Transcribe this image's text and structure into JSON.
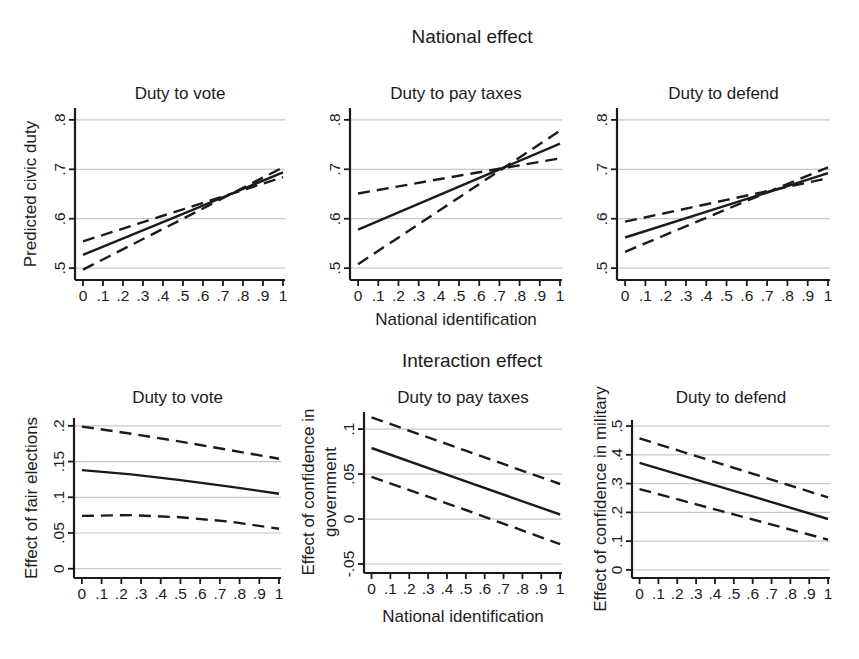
{
  "figure": {
    "row_titles": [
      "National effect",
      "Interaction effect"
    ],
    "x_axis": {
      "label": "National identification",
      "ticks": [
        0,
        0.1,
        0.2,
        0.3,
        0.4,
        0.5,
        0.6,
        0.7,
        0.8,
        0.9,
        1
      ],
      "tick_labels": [
        "0",
        ".1",
        ".2",
        ".3",
        ".4",
        ".5",
        ".6",
        ".7",
        ".8",
        ".9",
        "1"
      ],
      "xlim": [
        -0.04,
        1.01
      ]
    },
    "colors": {
      "line": "#1b1b1b",
      "grid": "#c8c8c8",
      "background": "#ffffff"
    },
    "grid": true,
    "legend": "none"
  },
  "chart_data": [
    {
      "type": "line",
      "title": "Duty to vote",
      "ylabel": "Predicted civic duty",
      "ylabel_lines": [
        "Predicted civic duty"
      ],
      "xlabel": "",
      "x": [
        0,
        0.5,
        1
      ],
      "series": [
        {
          "name": "estimate",
          "style": "solid",
          "y": [
            0.527,
            0.61,
            0.694
          ]
        },
        {
          "name": "ci-dashed-a",
          "style": "dashed",
          "y": [
            0.554,
            0.619,
            0.684
          ]
        },
        {
          "name": "ci-dashed-b",
          "style": "dashed",
          "y": [
            0.497,
            0.6,
            0.704
          ]
        }
      ],
      "ylim": [
        0.476,
        0.824
      ],
      "yticks": [
        0.5,
        0.6,
        0.7,
        0.8
      ],
      "ytick_labels": [
        ".5",
        ".6",
        ".7",
        ".8"
      ]
    },
    {
      "type": "line",
      "title": "Duty to pay taxes",
      "ylabel": "",
      "ylabel_lines": [],
      "xlabel": "National identification",
      "x": [
        0,
        0.5,
        1
      ],
      "series": [
        {
          "name": "estimate",
          "style": "solid",
          "y": [
            0.578,
            0.665,
            0.752
          ]
        },
        {
          "name": "ci-dashed-a",
          "style": "dashed",
          "y": [
            0.651,
            0.687,
            0.722
          ]
        },
        {
          "name": "ci-dashed-b",
          "style": "dashed",
          "y": [
            0.508,
            0.643,
            0.778
          ]
        }
      ],
      "ylim": [
        0.476,
        0.824
      ],
      "yticks": [
        0.5,
        0.6,
        0.7,
        0.8
      ],
      "ytick_labels": [
        ".5",
        ".6",
        ".7",
        ".8"
      ]
    },
    {
      "type": "line",
      "title": "Duty to defend",
      "ylabel": "",
      "ylabel_lines": [],
      "xlabel": "",
      "x": [
        0,
        0.5,
        1
      ],
      "series": [
        {
          "name": "estimate",
          "style": "solid",
          "y": [
            0.562,
            0.627,
            0.692
          ]
        },
        {
          "name": "ci-dashed-a",
          "style": "dashed",
          "y": [
            0.594,
            0.638,
            0.682
          ]
        },
        {
          "name": "ci-dashed-b",
          "style": "dashed",
          "y": [
            0.533,
            0.619,
            0.704
          ]
        }
      ],
      "ylim": [
        0.476,
        0.824
      ],
      "yticks": [
        0.5,
        0.6,
        0.7,
        0.8
      ],
      "ytick_labels": [
        ".5",
        ".6",
        ".7",
        ".8"
      ]
    },
    {
      "type": "line",
      "title": "Duty to vote",
      "ylabel": "Effect of fair elections",
      "ylabel_lines": [
        "Effect of fair elections"
      ],
      "xlabel": "",
      "x": [
        0,
        0.25,
        0.5,
        0.75,
        1
      ],
      "series": [
        {
          "name": "estimate",
          "style": "solid",
          "y": [
            0.138,
            0.132,
            0.124,
            0.115,
            0.105
          ]
        },
        {
          "name": "ci-upper",
          "style": "dashed",
          "y": [
            0.199,
            0.189,
            0.178,
            0.166,
            0.154
          ]
        },
        {
          "name": "ci-lower",
          "style": "dashed",
          "y": [
            0.074,
            0.075,
            0.072,
            0.066,
            0.056
          ]
        }
      ],
      "ylim": [
        -0.013,
        0.211
      ],
      "yticks": [
        0,
        0.05,
        0.1,
        0.15,
        0.2
      ],
      "ytick_labels": [
        "0",
        ".05",
        ".1",
        ".15",
        ".2"
      ]
    },
    {
      "type": "line",
      "title": "Duty to pay taxes",
      "ylabel": "Effect of confidence in government",
      "ylabel_lines": [
        "Effect of confidence in",
        "government"
      ],
      "xlabel": "National identification",
      "x": [
        0,
        0.5,
        1
      ],
      "series": [
        {
          "name": "estimate",
          "style": "solid",
          "y": [
            0.079,
            0.042,
            0.005
          ]
        },
        {
          "name": "ci-upper",
          "style": "dashed",
          "y": [
            0.113,
            0.076,
            0.039
          ]
        },
        {
          "name": "ci-lower",
          "style": "dashed",
          "y": [
            0.047,
            0.01,
            -0.028
          ]
        }
      ],
      "ylim": [
        -0.06,
        0.119
      ],
      "yticks": [
        -0.05,
        0,
        0.05,
        0.1
      ],
      "ytick_labels": [
        "-.05",
        "0",
        ".05",
        ".1"
      ]
    },
    {
      "type": "line",
      "title": "Duty to defend",
      "ylabel": "Effect of confidence in military",
      "ylabel_lines": [
        "Effect of confidence in military"
      ],
      "xlabel": "",
      "x": [
        0,
        0.5,
        1
      ],
      "series": [
        {
          "name": "estimate",
          "style": "solid",
          "y": [
            0.372,
            0.275,
            0.177
          ]
        },
        {
          "name": "ci-upper",
          "style": "dashed",
          "y": [
            0.457,
            0.355,
            0.252
          ]
        },
        {
          "name": "ci-lower",
          "style": "dashed",
          "y": [
            0.281,
            0.193,
            0.105
          ]
        }
      ],
      "ylim": [
        -0.028,
        0.521
      ],
      "yticks": [
        0,
        0.1,
        0.2,
        0.3,
        0.4,
        0.5
      ],
      "ytick_labels": [
        "0",
        ".1",
        ".2",
        ".3",
        ".4",
        ".5"
      ]
    }
  ]
}
